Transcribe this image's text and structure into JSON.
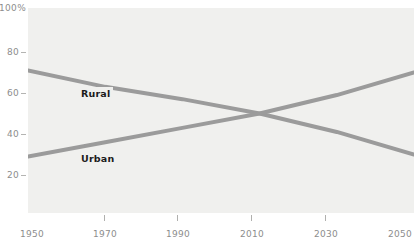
{
  "chart_data": {
    "type": "line",
    "title": "",
    "subtitle": "",
    "xlabel": "",
    "ylabel": "",
    "x": [
      1950,
      1970,
      1990,
      2010,
      2030,
      2050
    ],
    "xlim": [
      1950,
      2050
    ],
    "ylim": [
      0,
      100
    ],
    "grid": false,
    "legend_position": "inline-labels",
    "x_ticks": [
      "1950",
      "1970",
      "1990",
      "2010",
      "2030",
      "2050"
    ],
    "x_tick_marks": [
      "1970",
      "1990",
      "2010",
      "2030"
    ],
    "y_ticks": [
      "100%",
      "80",
      "60",
      "40",
      "20"
    ],
    "y_tick_values": [
      100,
      80,
      60,
      40,
      20
    ],
    "series": [
      {
        "name": "Rural",
        "color": "#9b9b9b",
        "values": [
          71,
          63,
          57,
          50,
          41,
          30
        ]
      },
      {
        "name": "Urban",
        "color": "#9b9b9b",
        "values": [
          29,
          36,
          43,
          50,
          59,
          70
        ]
      }
    ],
    "annotations": [
      {
        "text": "Rural",
        "x": 1972,
        "y": 58
      },
      {
        "text": "Urban",
        "x": 1972,
        "y": 33
      }
    ],
    "colors": {
      "plot_background": "#f0f0ee",
      "page_background": "#ffffff",
      "line": "#9b9b9b",
      "tick_label": "#8d8d8d",
      "annotation_text": "#1b1b1b"
    }
  }
}
